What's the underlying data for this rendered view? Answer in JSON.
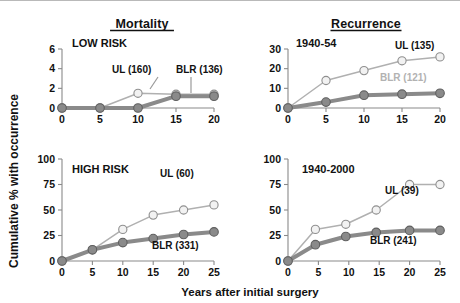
{
  "figure": {
    "ylabel": "Cumulative % with occurrence",
    "xlabel": "Years after initial surgery",
    "columns": [
      {
        "id": "mortality",
        "title": "Mortality"
      },
      {
        "id": "recurrence",
        "title": "Recurrence"
      }
    ],
    "colors": {
      "ul_line": "#b0b0b0",
      "ul_marker_fill": "#f2f2f2",
      "ul_marker_stroke": "#8f8f8f",
      "blr_line": "#8a8a8a",
      "blr_marker_fill": "#8a8a8a",
      "blr_marker_stroke": "#5f5f5f",
      "axis": "#8a8a8a",
      "text": "#111111",
      "muted_text": "#b2b2b2"
    }
  },
  "chart_data": [
    {
      "type": "line",
      "id": "mortality-low-risk",
      "title": "LOW RISK",
      "column": "Mortality",
      "xlabel": "Years after initial surgery",
      "ylabel": "Cumulative % with occurrence",
      "x": [
        0,
        5,
        10,
        15,
        20
      ],
      "xlim": [
        0,
        20
      ],
      "xticks": [
        0,
        5,
        10,
        15,
        20
      ],
      "ylim": [
        0,
        6
      ],
      "yticks": [
        0,
        2,
        4,
        6
      ],
      "series": [
        {
          "name": "UL",
          "n": 160,
          "label": "UL (160)",
          "marker": "open",
          "values": [
            0,
            0,
            1.5,
            1.4,
            1.4
          ]
        },
        {
          "name": "BLR",
          "n": 136,
          "label": "BLR (136)",
          "marker": "filled",
          "values": [
            0,
            0,
            0,
            1.2,
            1.2
          ]
        }
      ]
    },
    {
      "type": "line",
      "id": "mortality-high-risk",
      "title": "HIGH RISK",
      "column": "Mortality",
      "xlabel": "Years after initial surgery",
      "ylabel": "Cumulative % with occurrence",
      "x": [
        0,
        5,
        10,
        15,
        20,
        25
      ],
      "xlim": [
        0,
        25
      ],
      "xticks": [
        0,
        5,
        10,
        15,
        20,
        25
      ],
      "ylim": [
        0,
        100
      ],
      "yticks": [
        0,
        25,
        50,
        75,
        100
      ],
      "series": [
        {
          "name": "UL",
          "n": 60,
          "label": "UL (60)",
          "marker": "open",
          "values": [
            0,
            11,
            31,
            45,
            50,
            55
          ]
        },
        {
          "name": "BLR",
          "n": 331,
          "label": "BLR (331)",
          "marker": "filled",
          "values": [
            0,
            11,
            18,
            22,
            26,
            28.5
          ]
        }
      ]
    },
    {
      "type": "line",
      "id": "recurrence-1940-54",
      "title": "1940-54",
      "column": "Recurrence",
      "xlabel": "Years after initial surgery",
      "ylabel": "Cumulative % with occurrence",
      "x": [
        0,
        5,
        10,
        15,
        20
      ],
      "xlim": [
        0,
        20
      ],
      "xticks": [
        0,
        5,
        10,
        15,
        20
      ],
      "ylim": [
        0,
        30
      ],
      "yticks": [
        0,
        10,
        20,
        30
      ],
      "series": [
        {
          "name": "UL",
          "n": 135,
          "label": "UL (135)",
          "marker": "open",
          "values": [
            0,
            14,
            19,
            24,
            26
          ]
        },
        {
          "name": "BLR",
          "n": 121,
          "label": "BLR (121)",
          "marker": "filled",
          "values": [
            0,
            3,
            6.5,
            7,
            7.5
          ]
        }
      ]
    },
    {
      "type": "line",
      "id": "recurrence-1940-2000",
      "title": "1940-2000",
      "column": "Recurrence",
      "xlabel": "Years after initial surgery",
      "ylabel": "Cumulative % with occurrence",
      "x": [
        0,
        4.5,
        9.5,
        14.5,
        20,
        25
      ],
      "xlim": [
        0,
        25
      ],
      "xticks": [
        0,
        5,
        10,
        15,
        20,
        25
      ],
      "ylim": [
        0,
        100
      ],
      "yticks": [
        0,
        25,
        50,
        75,
        100
      ],
      "series": [
        {
          "name": "UL",
          "n": 39,
          "label": "UL (39)",
          "marker": "open",
          "values": [
            0,
            31,
            36,
            50,
            75,
            75
          ]
        },
        {
          "name": "BLR",
          "n": 241,
          "label": "BLR (241)",
          "marker": "filled",
          "values": [
            0,
            16,
            24,
            28,
            30,
            30
          ]
        }
      ]
    }
  ],
  "annotations": {
    "mortality-low-risk": [
      {
        "label": "UL (160)",
        "x": 112,
        "y": 72,
        "anchor": "start",
        "muted": false,
        "leader": [
          [
            158,
            76
          ],
          [
            150,
            88
          ]
        ]
      },
      {
        "label": "BLR (136)",
        "x": 176,
        "y": 72,
        "anchor": "start",
        "muted": false,
        "leader": [
          [
            191,
            76
          ],
          [
            191,
            92
          ]
        ]
      }
    ],
    "mortality-high-risk": [
      {
        "label": "UL (60)",
        "x": 160,
        "y": 176,
        "anchor": "start",
        "muted": false,
        "leader": null
      },
      {
        "label": "BLR (331)",
        "x": 152,
        "y": 248,
        "anchor": "start",
        "muted": false,
        "leader": null
      }
    ],
    "recurrence-1940-54": [
      {
        "label": "UL (135)",
        "x": 395,
        "y": 48,
        "anchor": "start",
        "muted": false,
        "leader": null
      },
      {
        "label": "BLR (121)",
        "x": 380,
        "y": 80,
        "anchor": "start",
        "muted": true,
        "leader": null
      }
    ],
    "recurrence-1940-2000": [
      {
        "label": "UL (39)",
        "x": 385,
        "y": 193,
        "anchor": "start",
        "muted": false,
        "leader": null
      },
      {
        "label": "BLR (241)",
        "x": 370,
        "y": 243,
        "anchor": "start",
        "muted": false,
        "leader": null
      }
    ]
  },
  "layout": {
    "panels": [
      {
        "id": "mortality-low-risk",
        "plot": {
          "x": 62,
          "y": 48,
          "w": 152,
          "h": 59
        },
        "title_pos": {
          "x": 72,
          "y": 46
        }
      },
      {
        "id": "mortality-high-risk",
        "plot": {
          "x": 62,
          "y": 158,
          "w": 152,
          "h": 102
        },
        "title_pos": {
          "x": 72,
          "y": 172
        }
      },
      {
        "id": "recurrence-1940-54",
        "plot": {
          "x": 288,
          "y": 48,
          "w": 152,
          "h": 59
        },
        "title_pos": {
          "x": 296,
          "y": 46
        }
      },
      {
        "id": "recurrence-1940-2000",
        "plot": {
          "x": 288,
          "y": 158,
          "w": 152,
          "h": 102
        },
        "title_pos": {
          "x": 302,
          "y": 172
        }
      }
    ],
    "column_titles": [
      {
        "text": "Mortality",
        "x": 142,
        "y": 27
      },
      {
        "text": "Recurrence",
        "x": 366,
        "y": 27
      }
    ],
    "ylabel_pos": {
      "x": 18,
      "y": 180
    },
    "xlabel_pos": {
      "x": 250,
      "y": 295
    }
  }
}
